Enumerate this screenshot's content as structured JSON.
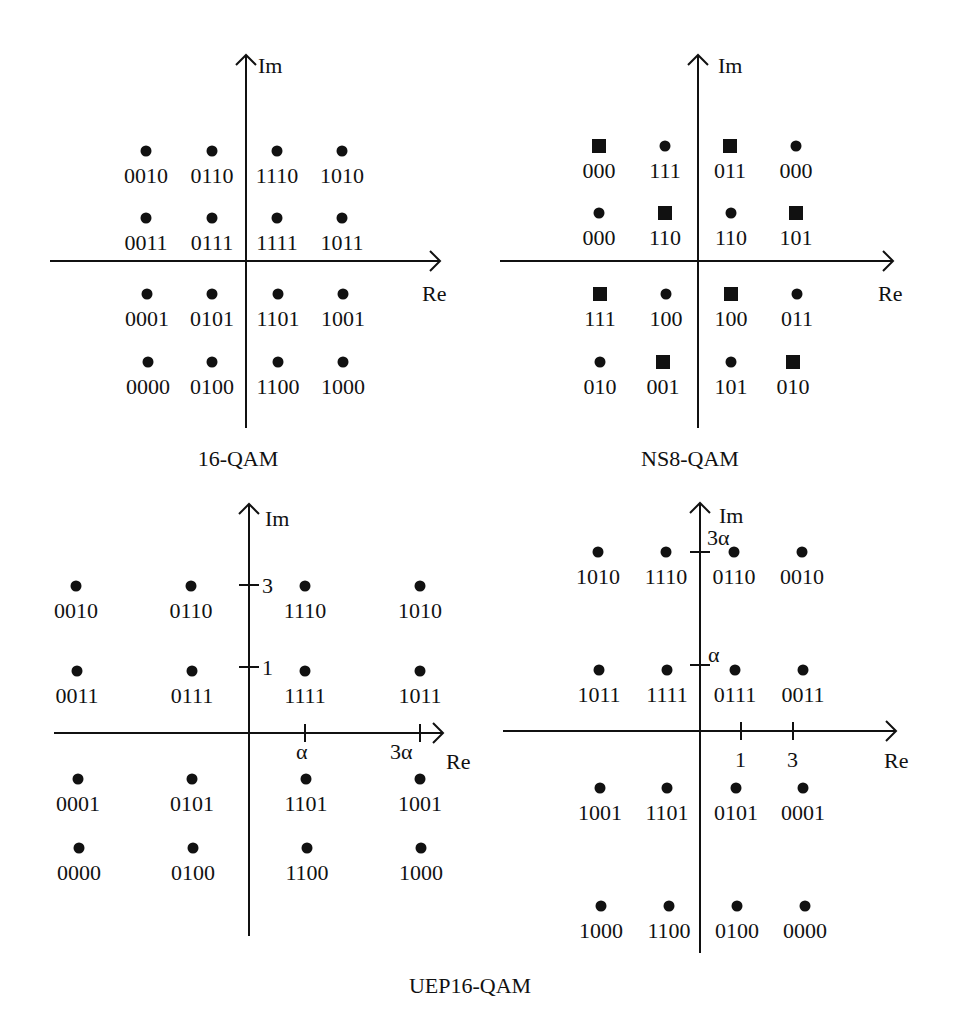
{
  "figure": {
    "width": 956,
    "height": 1023,
    "color": "#111111"
  },
  "chart_data": [
    {
      "type": "scatter",
      "title": "16-QAM",
      "xlabel": "Re",
      "ylabel": "Im",
      "origin": [
        246,
        261
      ],
      "axis": {
        "x_from": 50,
        "x_to": 440,
        "y_from": 428,
        "y_to": 55
      },
      "title_pos": [
        238,
        466
      ],
      "xlabel_pos": [
        422,
        301
      ],
      "ylabel_pos": [
        258,
        73
      ],
      "x_ticks": [],
      "y_ticks": [],
      "points": [
        {
          "x": 146,
          "y": 151,
          "label": "0010",
          "marker": "circle"
        },
        {
          "x": 212,
          "y": 151,
          "label": "0110",
          "marker": "circle"
        },
        {
          "x": 277,
          "y": 151,
          "label": "1110",
          "marker": "circle"
        },
        {
          "x": 342,
          "y": 151,
          "label": "1010",
          "marker": "circle"
        },
        {
          "x": 146,
          "y": 218,
          "label": "0011",
          "marker": "circle"
        },
        {
          "x": 212,
          "y": 218,
          "label": "0111",
          "marker": "circle"
        },
        {
          "x": 277,
          "y": 218,
          "label": "1111",
          "marker": "circle"
        },
        {
          "x": 342,
          "y": 218,
          "label": "1011",
          "marker": "circle"
        },
        {
          "x": 147,
          "y": 294,
          "label": "0001",
          "marker": "circle"
        },
        {
          "x": 212,
          "y": 294,
          "label": "0101",
          "marker": "circle"
        },
        {
          "x": 278,
          "y": 294,
          "label": "1101",
          "marker": "circle"
        },
        {
          "x": 343,
          "y": 294,
          "label": "1001",
          "marker": "circle"
        },
        {
          "x": 148,
          "y": 362,
          "label": "0000",
          "marker": "circle"
        },
        {
          "x": 212,
          "y": 362,
          "label": "0100",
          "marker": "circle"
        },
        {
          "x": 278,
          "y": 362,
          "label": "1100",
          "marker": "circle"
        },
        {
          "x": 343,
          "y": 362,
          "label": "1000",
          "marker": "circle"
        }
      ]
    },
    {
      "type": "scatter",
      "title": "NS8-QAM",
      "xlabel": "Re",
      "ylabel": "Im",
      "origin": [
        698,
        261
      ],
      "axis": {
        "x_from": 500,
        "x_to": 893,
        "y_from": 428,
        "y_to": 55
      },
      "title_pos": [
        690,
        466
      ],
      "xlabel_pos": [
        878,
        301
      ],
      "ylabel_pos": [
        718,
        73
      ],
      "x_ticks": [],
      "y_ticks": [],
      "points": [
        {
          "x": 599,
          "y": 146,
          "label": "000",
          "marker": "square"
        },
        {
          "x": 665,
          "y": 146,
          "label": "111",
          "marker": "circle"
        },
        {
          "x": 730,
          "y": 146,
          "label": "011",
          "marker": "square"
        },
        {
          "x": 796,
          "y": 146,
          "label": "000",
          "marker": "circle"
        },
        {
          "x": 599,
          "y": 213,
          "label": "000",
          "marker": "circle"
        },
        {
          "x": 665,
          "y": 213,
          "label": "110",
          "marker": "square"
        },
        {
          "x": 731,
          "y": 213,
          "label": "110",
          "marker": "circle"
        },
        {
          "x": 796,
          "y": 213,
          "label": "101",
          "marker": "square"
        },
        {
          "x": 600,
          "y": 294,
          "label": "111",
          "marker": "square"
        },
        {
          "x": 666,
          "y": 294,
          "label": "100",
          "marker": "circle"
        },
        {
          "x": 731,
          "y": 294,
          "label": "100",
          "marker": "square"
        },
        {
          "x": 797,
          "y": 294,
          "label": "011",
          "marker": "circle"
        },
        {
          "x": 600,
          "y": 362,
          "label": "010",
          "marker": "circle"
        },
        {
          "x": 663,
          "y": 362,
          "label": "001",
          "marker": "square"
        },
        {
          "x": 731,
          "y": 362,
          "label": "101",
          "marker": "circle"
        },
        {
          "x": 793,
          "y": 362,
          "label": "010",
          "marker": "square"
        }
      ]
    },
    {
      "type": "scatter",
      "title": "UEP16-QAM (left)",
      "xlabel": "Re",
      "ylabel": "Im",
      "origin": [
        249,
        733
      ],
      "axis": {
        "x_from": 54,
        "x_to": 443,
        "y_from": 936,
        "y_to": 504
      },
      "title_pos": [
        0,
        0
      ],
      "xlabel_pos": [
        446,
        769
      ],
      "ylabel_pos": [
        265,
        526
      ],
      "x_ticks": [
        {
          "pos": 305,
          "label": "α",
          "lx": 296,
          "ly": 759
        },
        {
          "pos": 420,
          "label": "3α",
          "lx": 390,
          "ly": 759
        }
      ],
      "y_ticks": [
        {
          "pos": 585,
          "label": "3",
          "lx": 262,
          "ly": 593
        },
        {
          "pos": 667,
          "label": "1",
          "lx": 262,
          "ly": 675
        }
      ],
      "points": [
        {
          "x": 76,
          "y": 586,
          "label": "0010",
          "marker": "circle"
        },
        {
          "x": 191,
          "y": 586,
          "label": "0110",
          "marker": "circle"
        },
        {
          "x": 305,
          "y": 586,
          "label": "1110",
          "marker": "circle"
        },
        {
          "x": 420,
          "y": 586,
          "label": "1010",
          "marker": "circle"
        },
        {
          "x": 77,
          "y": 671,
          "label": "0011",
          "marker": "circle"
        },
        {
          "x": 192,
          "y": 671,
          "label": "0111",
          "marker": "circle"
        },
        {
          "x": 305,
          "y": 671,
          "label": "1111",
          "marker": "circle"
        },
        {
          "x": 420,
          "y": 671,
          "label": "1011",
          "marker": "circle"
        },
        {
          "x": 78,
          "y": 779,
          "label": "0001",
          "marker": "circle"
        },
        {
          "x": 192,
          "y": 779,
          "label": "0101",
          "marker": "circle"
        },
        {
          "x": 306,
          "y": 779,
          "label": "1101",
          "marker": "circle"
        },
        {
          "x": 420,
          "y": 779,
          "label": "1001",
          "marker": "circle"
        },
        {
          "x": 79,
          "y": 848,
          "label": "0000",
          "marker": "circle"
        },
        {
          "x": 193,
          "y": 848,
          "label": "0100",
          "marker": "circle"
        },
        {
          "x": 307,
          "y": 848,
          "label": "1100",
          "marker": "circle"
        },
        {
          "x": 421,
          "y": 848,
          "label": "1000",
          "marker": "circle"
        }
      ]
    },
    {
      "type": "scatter",
      "title": "UEP16-QAM (right)",
      "xlabel": "Re",
      "ylabel": "Im",
      "origin": [
        700,
        731
      ],
      "axis": {
        "x_from": 503,
        "x_to": 896,
        "y_from": 953,
        "y_to": 503
      },
      "title_pos": [
        0,
        0
      ],
      "xlabel_pos": [
        884,
        768
      ],
      "ylabel_pos": [
        719,
        523
      ],
      "x_ticks": [
        {
          "pos": 741,
          "label": "1",
          "lx": 735,
          "ly": 767
        },
        {
          "pos": 793,
          "label": "3",
          "lx": 787,
          "ly": 767
        }
      ],
      "y_ticks": [
        {
          "pos": 552,
          "label": "3α",
          "lx": 707,
          "ly": 545
        },
        {
          "pos": 665,
          "label": "α",
          "lx": 708,
          "ly": 662
        }
      ],
      "points": [
        {
          "x": 598,
          "y": 552,
          "label": "1010",
          "marker": "circle"
        },
        {
          "x": 666,
          "y": 552,
          "label": "1110",
          "marker": "circle"
        },
        {
          "x": 734,
          "y": 552,
          "label": "0110",
          "marker": "circle"
        },
        {
          "x": 802,
          "y": 552,
          "label": "0010",
          "marker": "circle"
        },
        {
          "x": 599,
          "y": 670,
          "label": "1011",
          "marker": "circle"
        },
        {
          "x": 667,
          "y": 670,
          "label": "1111",
          "marker": "circle"
        },
        {
          "x": 735,
          "y": 670,
          "label": "0111",
          "marker": "circle"
        },
        {
          "x": 803,
          "y": 670,
          "label": "0011",
          "marker": "circle"
        },
        {
          "x": 600,
          "y": 788,
          "label": "1001",
          "marker": "circle"
        },
        {
          "x": 667,
          "y": 788,
          "label": "1101",
          "marker": "circle"
        },
        {
          "x": 736,
          "y": 788,
          "label": "0101",
          "marker": "circle"
        },
        {
          "x": 803,
          "y": 788,
          "label": "0001",
          "marker": "circle"
        },
        {
          "x": 601,
          "y": 906,
          "label": "1000",
          "marker": "circle"
        },
        {
          "x": 669,
          "y": 906,
          "label": "1100",
          "marker": "circle"
        },
        {
          "x": 737,
          "y": 906,
          "label": "0100",
          "marker": "circle"
        },
        {
          "x": 805,
          "y": 906,
          "label": "0000",
          "marker": "circle"
        }
      ]
    }
  ],
  "captions": {
    "qam16": "16-QAM",
    "ns8qam": "NS8-QAM",
    "uep16qam": "UEP16-QAM"
  },
  "caption_pos": {
    "qam16": [
      238,
      466
    ],
    "ns8qam": [
      690,
      466
    ],
    "uep16qam": [
      470,
      993
    ]
  }
}
